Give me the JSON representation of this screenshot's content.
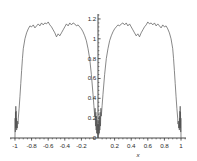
{
  "chart_data": {
    "type": "line",
    "title": "",
    "subtitle": "",
    "xlabel": "x",
    "ylabel": "",
    "xlim": [
      -1.06,
      1.06
    ],
    "ylim": [
      0,
      1.25
    ],
    "grid": false,
    "legend": null,
    "line_color": "#555555",
    "axis_color": "#333333",
    "background": "#ffffff",
    "xticks": [
      {
        "value": -1,
        "label": "-1"
      },
      {
        "value": -0.8,
        "label": "-0.8"
      },
      {
        "value": -0.6,
        "label": "-0.6"
      },
      {
        "value": -0.4,
        "label": "-0.4"
      },
      {
        "value": -0.2,
        "label": "-0.2"
      },
      {
        "value": 0.2,
        "label": "0.2"
      },
      {
        "value": 0.4,
        "label": "0.4"
      },
      {
        "value": 0.6,
        "label": "0.6"
      },
      {
        "value": 0.8,
        "label": "0.8"
      },
      {
        "value": 1,
        "label": "1"
      }
    ],
    "yticks": [
      {
        "value": 0,
        "label": "0"
      },
      {
        "value": 0.2,
        "label": "0.2"
      },
      {
        "value": 0.4,
        "label": "0.4"
      },
      {
        "value": 0.6,
        "label": "0.6"
      },
      {
        "value": 0.8,
        "label": "0.8"
      },
      {
        "value": 1,
        "label": "1"
      },
      {
        "value": 1.2,
        "label": "1.2"
      }
    ],
    "yaxis_position": 0,
    "series": [
      {
        "name": "curve",
        "x": [
          -1.0,
          -0.998,
          -0.996,
          -0.994,
          -0.992,
          -0.99,
          -0.988,
          -0.986,
          -0.984,
          -0.982,
          -0.98,
          -0.976,
          -0.972,
          -0.968,
          -0.964,
          -0.96,
          -0.95,
          -0.94,
          -0.93,
          -0.92,
          -0.91,
          -0.9,
          -0.88,
          -0.86,
          -0.84,
          -0.82,
          -0.8,
          -0.78,
          -0.76,
          -0.74,
          -0.72,
          -0.7,
          -0.68,
          -0.66,
          -0.64,
          -0.62,
          -0.6,
          -0.58,
          -0.56,
          -0.54,
          -0.52,
          -0.5,
          -0.48,
          -0.46,
          -0.44,
          -0.42,
          -0.4,
          -0.38,
          -0.36,
          -0.34,
          -0.32,
          -0.3,
          -0.28,
          -0.26,
          -0.24,
          -0.22,
          -0.2,
          -0.18,
          -0.16,
          -0.14,
          -0.12,
          -0.1,
          -0.08,
          -0.06,
          -0.05,
          -0.04,
          -0.035,
          -0.03,
          -0.026,
          -0.022,
          -0.018,
          -0.015,
          -0.012,
          -0.009,
          -0.006,
          -0.003,
          0.0,
          0.003,
          0.006,
          0.009,
          0.012,
          0.015,
          0.018,
          0.022,
          0.026,
          0.03,
          0.035,
          0.04,
          0.05,
          0.06,
          0.08,
          0.1,
          0.12,
          0.14,
          0.16,
          0.18,
          0.2,
          0.22,
          0.24,
          0.26,
          0.28,
          0.3,
          0.32,
          0.34,
          0.36,
          0.38,
          0.4,
          0.42,
          0.44,
          0.46,
          0.48,
          0.5,
          0.52,
          0.54,
          0.56,
          0.58,
          0.6,
          0.62,
          0.64,
          0.66,
          0.68,
          0.7,
          0.72,
          0.74,
          0.76,
          0.78,
          0.8,
          0.82,
          0.84,
          0.86,
          0.88,
          0.9,
          0.91,
          0.92,
          0.93,
          0.94,
          0.95,
          0.96,
          0.964,
          0.968,
          0.972,
          0.976,
          0.98,
          0.982,
          0.984,
          0.986,
          0.988,
          0.99,
          0.992,
          0.994,
          0.996,
          0.998,
          1.0
        ],
        "y": [
          0.0,
          0.2,
          0.06,
          0.26,
          0.1,
          0.32,
          0.12,
          0.27,
          0.1,
          0.2,
          0.08,
          0.14,
          0.1,
          0.17,
          0.14,
          0.2,
          0.3,
          0.42,
          0.55,
          0.68,
          0.8,
          0.9,
          1.0,
          1.06,
          1.1,
          1.13,
          1.12,
          1.14,
          1.11,
          1.13,
          1.15,
          1.13,
          1.16,
          1.14,
          1.16,
          1.15,
          1.17,
          1.14,
          1.12,
          1.09,
          1.06,
          1.02,
          1.05,
          1.03,
          1.06,
          1.09,
          1.12,
          1.15,
          1.13,
          1.16,
          1.14,
          1.16,
          1.15,
          1.13,
          1.14,
          1.12,
          1.1,
          1.07,
          1.03,
          0.98,
          0.9,
          0.8,
          0.64,
          0.44,
          0.33,
          0.22,
          0.3,
          0.12,
          0.26,
          0.08,
          0.22,
          0.05,
          0.18,
          0.04,
          0.14,
          0.03,
          0.0,
          0.03,
          0.14,
          0.04,
          0.18,
          0.05,
          0.22,
          0.08,
          0.26,
          0.12,
          0.3,
          0.22,
          0.33,
          0.44,
          0.64,
          0.8,
          0.9,
          0.98,
          1.03,
          1.07,
          1.1,
          1.12,
          1.14,
          1.13,
          1.15,
          1.16,
          1.14,
          1.16,
          1.13,
          1.15,
          1.12,
          1.09,
          1.06,
          1.03,
          1.05,
          1.02,
          1.06,
          1.09,
          1.12,
          1.14,
          1.17,
          1.15,
          1.16,
          1.14,
          1.16,
          1.13,
          1.15,
          1.13,
          1.11,
          1.14,
          1.12,
          1.13,
          1.1,
          1.06,
          1.0,
          0.9,
          0.8,
          0.68,
          0.55,
          0.42,
          0.3,
          0.2,
          0.14,
          0.17,
          0.1,
          0.14,
          0.08,
          0.2,
          0.1,
          0.27,
          0.12,
          0.32,
          0.1,
          0.26,
          0.06,
          0.2,
          0.0
        ]
      }
    ]
  }
}
